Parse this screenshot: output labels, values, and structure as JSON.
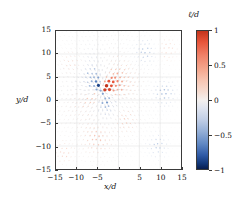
{
  "figure": {
    "background": "#ffffff",
    "frame_color": "#3a3a3a",
    "grid_color": "#dcdcdc"
  },
  "axes": {
    "x_title": "x/d",
    "y_title": "y/d"
  },
  "colorbar": {
    "title": "ℓ/d",
    "ticks": [
      1,
      0.5,
      0,
      -0.5,
      -1
    ],
    "tick_labels": [
      "1",
      "0.5",
      "0",
      "−0.5",
      "−1"
    ],
    "vmin": -1,
    "vmax": 1,
    "colormap": "RdBu_r-diverging",
    "color_positive": "#c3341c",
    "color_zero": "#f4f0ee",
    "color_negative": "#081d4e"
  },
  "chart_data": {
    "type": "scatter",
    "title": "",
    "xlabel": "x/d",
    "ylabel": "y/d",
    "xlim": [
      -15,
      15
    ],
    "ylim": [
      -15,
      15
    ],
    "xticks": [
      -15,
      -10,
      -5,
      0,
      5,
      10,
      15
    ],
    "yticks": [
      -15,
      -10,
      -5,
      0,
      5,
      10,
      15
    ],
    "xtick_labels": [
      "−15",
      "−10",
      "−5",
      "0",
      "5",
      "10",
      "15"
    ],
    "ytick_labels": [
      "−15",
      "−10",
      "−5",
      "0",
      "5",
      "10",
      "15"
    ],
    "grid": true,
    "legend": "none",
    "colorbar_label": "ℓ/d",
    "clim": [
      -1,
      1
    ],
    "lattice": {
      "spacing": 1.02,
      "rows": 30,
      "stagger": true,
      "jitter": 0.13
    },
    "field": {
      "center_x": -4.0,
      "center_y": 2.0,
      "core_radius": 5.2,
      "decay_length": 6.4,
      "quadrupole_angle_deg": 32,
      "quadrupole_weight": 0.72,
      "radial_weight": 0.55,
      "vector_scale": 0.95,
      "max_amplitude": 1.0
    },
    "secondary_centers": [
      {
        "x": 6.5,
        "y": 10.5,
        "amp": -0.55,
        "radius": 2.2
      },
      {
        "x": 11.5,
        "y": 11.0,
        "amp": 0.45,
        "radius": 1.8
      },
      {
        "x": 11.0,
        "y": 1.5,
        "amp": -0.6,
        "radius": 2.0
      },
      {
        "x": -5.0,
        "y": -8.5,
        "amp": 0.5,
        "radius": 2.4
      },
      {
        "x": 9.5,
        "y": -10.0,
        "amp": -0.5,
        "radius": 1.9
      },
      {
        "x": -13.0,
        "y": -11.5,
        "amp": 0.4,
        "radius": 1.6
      },
      {
        "x": 1.5,
        "y": -4.5,
        "amp": 0.45,
        "radius": 2.2
      },
      {
        "x": -11.0,
        "y": 8.0,
        "amp": 0.4,
        "radius": 2.0
      }
    ]
  }
}
